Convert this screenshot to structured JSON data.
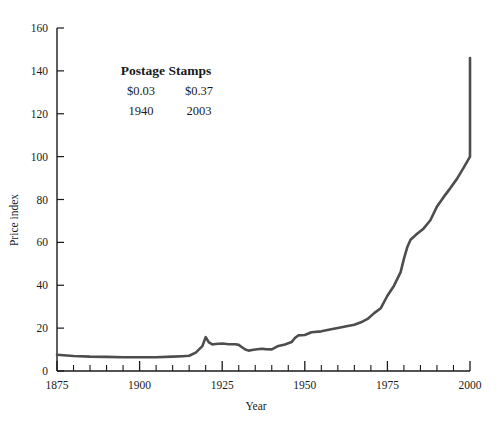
{
  "chart_data": {
    "type": "line",
    "title": "",
    "xlabel": "Year",
    "ylabel": "Price index",
    "xlim": [
      1875,
      2000
    ],
    "ylim": [
      0,
      160
    ],
    "grid": false,
    "legend": null,
    "x_ticks_major": [
      1875,
      1900,
      1925,
      1950,
      1975,
      2000
    ],
    "x_tick_labels": [
      "1875",
      "1900",
      "1925",
      "1950",
      "1975",
      "2000"
    ],
    "x_minor_step": 5,
    "y_ticks": [
      0,
      20,
      40,
      60,
      80,
      100,
      120,
      140,
      160
    ],
    "y_tick_labels": [
      "0",
      "20",
      "40",
      "60",
      "80",
      "100",
      "120",
      "140",
      "160"
    ],
    "line_color": "#4d4d4d",
    "line_width": 2.6,
    "series": [
      {
        "name": "Price index",
        "x": [
          1875,
          1880,
          1885,
          1890,
          1895,
          1900,
          1905,
          1910,
          1913,
          1915,
          1917,
          1918,
          1919,
          1920,
          1921,
          1922,
          1923,
          1925,
          1927,
          1929,
          1930,
          1931,
          1932,
          1933,
          1934,
          1935,
          1937,
          1938,
          1940,
          1942,
          1944,
          1946,
          1947,
          1948,
          1950,
          1952,
          1955,
          1958,
          1960,
          1963,
          1965,
          1967,
          1969,
          1971,
          1973,
          1975,
          1977,
          1979,
          1980,
          1981,
          1982,
          1984,
          1986,
          1988,
          1990,
          1992,
          1994,
          1996,
          1998,
          2000,
          2003
        ],
        "y": [
          7.6,
          7.0,
          6.7,
          6.6,
          6.4,
          6.4,
          6.4,
          6.7,
          6.9,
          7.1,
          8.6,
          10.1,
          11.6,
          15.8,
          13.3,
          12.4,
          12.6,
          12.8,
          12.5,
          12.5,
          12.2,
          11.1,
          10.0,
          9.5,
          9.8,
          10.0,
          10.4,
          10.2,
          10.1,
          11.7,
          12.4,
          13.5,
          15.4,
          16.6,
          16.8,
          18.1,
          18.5,
          19.5,
          20.1,
          21.0,
          21.6,
          22.7,
          24.3,
          27.0,
          29.3,
          35.1,
          39.8,
          46.1,
          52.3,
          57.7,
          61.2,
          64.0,
          66.5,
          70.3,
          76.7,
          81.1,
          85.2,
          89.5,
          94.6,
          100.0,
          146.0
        ]
      }
    ],
    "annotation": {
      "title": "Postage Stamps",
      "rows": [
        {
          "left": "$0.03",
          "right": "$0.37"
        },
        {
          "left": "1940",
          "right": "2003"
        }
      ]
    }
  }
}
